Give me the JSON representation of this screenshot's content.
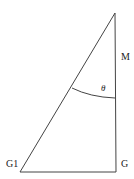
{
  "diagram": {
    "type": "right-triangle",
    "stroke_color": "#444444",
    "points": {
      "apex": [
        115,
        13
      ],
      "G": [
        116,
        172
      ],
      "G1": [
        20,
        172
      ]
    },
    "labels": {
      "M": "M",
      "G": "G",
      "G1": "G1",
      "angle": "θ"
    }
  }
}
